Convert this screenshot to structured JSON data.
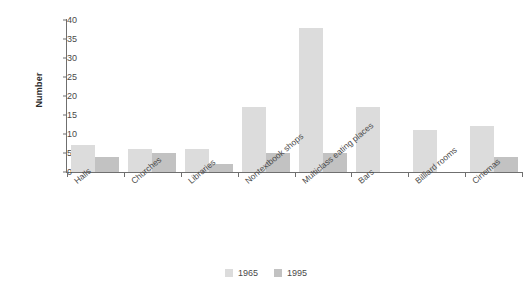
{
  "chart_data": {
    "type": "bar",
    "title": "",
    "xlabel": "",
    "ylabel": "Number",
    "ylim": [
      0,
      40
    ],
    "yticks": [
      0,
      5,
      10,
      15,
      20,
      25,
      30,
      35,
      40
    ],
    "grid": false,
    "legend_position": "bottom",
    "categories": [
      "Halls",
      "Churches",
      "Libraries",
      "Nontextbook shops",
      "Multiclass eating places",
      "Bars",
      "Billiard rooms",
      "Cinemas"
    ],
    "series": [
      {
        "name": "1965",
        "color": "#dcdcdc",
        "values": [
          7,
          6,
          6,
          17,
          38,
          17,
          11,
          12
        ]
      },
      {
        "name": "1995",
        "color": "#c2c2c2",
        "values": [
          4,
          5,
          2,
          5,
          5,
          0,
          0,
          4
        ]
      }
    ]
  },
  "colors": {
    "axis": "#6f6f6f",
    "text": "#4a4a4a",
    "background": "#ffffff"
  }
}
